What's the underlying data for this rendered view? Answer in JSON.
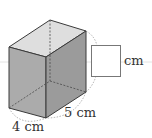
{
  "figure": {
    "type": "rectangular-prism-with-net-answer-box",
    "colors": {
      "top_face": "#dedede",
      "front_face": "#ababab",
      "right_face": "#9b9b9b",
      "edge": "#3a3a3a",
      "hidden_edge": "#555555",
      "arc": "#999999",
      "guide_line": "#e2e2e2",
      "answer_box_border": "#777777"
    },
    "labels": {
      "depth_label": "4 cm",
      "width_label": "5 cm",
      "answer_unit": "cm"
    },
    "answer_box": {
      "value": ""
    }
  }
}
